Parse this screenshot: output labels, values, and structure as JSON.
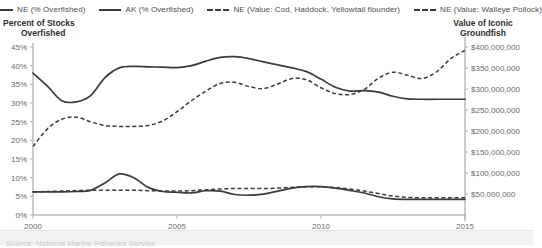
{
  "legend": {
    "items": [
      {
        "label": "NE (% Overfished)",
        "style": "solid"
      },
      {
        "label": "AK (% Overfished)",
        "style": "solid"
      },
      {
        "label": "NE (Value: Cod, Haddock, Yellowtail flounder)",
        "style": "dashed"
      },
      {
        "label": "NE (Value: Walleye Pollock)",
        "style": "dashed"
      }
    ]
  },
  "axes": {
    "left_title_line1": "Percent of Stocks",
    "left_title_line2": "Overfished",
    "right_title_line1": "Value of Iconic",
    "right_title_line2": "Groundfish"
  },
  "footer": {
    "text": "Source: National Marine Fisheries Service"
  },
  "chart_data": {
    "type": "line",
    "title": "",
    "xlabel": "",
    "ylabel": "Percent of Stocks Overfished",
    "y2label": "Value of Iconic Groundfish",
    "grid": false,
    "legend_position": "top",
    "xlim": [
      2000,
      2015
    ],
    "x_ticks": [
      2000,
      2005,
      2010,
      2015
    ],
    "x_tick_labels": [
      "2000",
      "2005",
      "2010",
      "2015"
    ],
    "ylim": [
      0,
      45
    ],
    "y_ticks": [
      0,
      5,
      10,
      15,
      20,
      25,
      30,
      35,
      40,
      45
    ],
    "y_tick_labels": [
      "0%",
      "5%",
      "10%",
      "15%",
      "20%",
      "25%",
      "30%",
      "35%",
      "40%",
      "45%"
    ],
    "y2lim": [
      0,
      400000000
    ],
    "y2_ticks": [
      50000000,
      100000000,
      150000000,
      200000000,
      250000000,
      300000000,
      350000000,
      400000000
    ],
    "y2_tick_labels": [
      "$50,000,000",
      "$100,000,000",
      "$150,000,000",
      "$200,000,000",
      "$250,000,000",
      "$300,000,000",
      "$350,000,000",
      "$400,000,000"
    ],
    "x": [
      2000,
      2000.5,
      2001,
      2001.5,
      2002,
      2002.5,
      2003,
      2003.5,
      2004,
      2004.5,
      2005,
      2005.5,
      2006,
      2006.5,
      2007,
      2007.5,
      2008,
      2008.5,
      2009,
      2009.5,
      2010,
      2010.5,
      2011,
      2011.5,
      2012,
      2012.5,
      2013,
      2013.5,
      2014,
      2014.5,
      2015
    ],
    "series": [
      {
        "name": "NE (% Overfished)",
        "style": "solid",
        "axis": "left",
        "unit": "percent",
        "values": [
          38.0,
          34.5,
          30.6,
          30.3,
          32.0,
          36.8,
          39.4,
          39.8,
          39.7,
          39.6,
          39.5,
          40.0,
          41.2,
          42.2,
          42.4,
          41.9,
          41.0,
          40.2,
          39.4,
          38.4,
          36.4,
          34.2,
          33.2,
          33.3,
          32.9,
          31.8,
          31.1,
          31.0,
          31.0,
          31.0,
          31.0
        ]
      },
      {
        "name": "AK (% Overfished)",
        "style": "solid",
        "axis": "left",
        "unit": "percent",
        "values": [
          6.2,
          6.2,
          6.2,
          6.3,
          6.6,
          8.6,
          11.0,
          10.0,
          7.4,
          6.3,
          6.1,
          5.9,
          6.5,
          6.4,
          5.5,
          5.3,
          5.6,
          6.4,
          7.2,
          7.6,
          7.6,
          7.2,
          6.6,
          5.9,
          4.9,
          4.3,
          4.2,
          4.2,
          4.2,
          4.2,
          4.2
        ]
      },
      {
        "name": "NE (Value: Cod, Haddock, Yellowtail flounder)",
        "style": "dashed",
        "axis": "right",
        "unit": "dollars",
        "values": [
          163000000,
          205000000,
          228000000,
          233000000,
          222000000,
          213000000,
          211000000,
          211000000,
          213000000,
          224000000,
          246000000,
          272000000,
          295000000,
          313000000,
          316000000,
          306000000,
          301000000,
          312000000,
          325000000,
          322000000,
          303000000,
          289000000,
          287000000,
          299000000,
          326000000,
          340000000,
          333000000,
          325000000,
          340000000,
          372000000,
          392000000
        ]
      },
      {
        "name": "NE (Value: Walleye Pollock)",
        "style": "dashed",
        "axis": "right",
        "unit": "dollars",
        "values": [
          55000000,
          56000000,
          57000000,
          58000000,
          59000000,
          59000000,
          59000000,
          59000000,
          58000000,
          57000000,
          57000000,
          58000000,
          60000000,
          62000000,
          63000000,
          63000000,
          63000000,
          64000000,
          66000000,
          67000000,
          67000000,
          65000000,
          62000000,
          57000000,
          51000000,
          45000000,
          42000000,
          41000000,
          41000000,
          41000000,
          41000000
        ]
      }
    ]
  }
}
